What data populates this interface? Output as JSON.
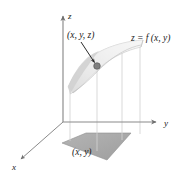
{
  "figure": {
    "background_color": "#ffffff",
    "width": 190,
    "height": 176,
    "axes": {
      "origin": {
        "x": 63,
        "y": 122
      },
      "x_axis": {
        "label": "x",
        "label_x": 14,
        "label_y": 168,
        "direction": "down-left",
        "tip_x": 18,
        "tip_y": 161,
        "color": "#6e6e6e"
      },
      "y_axis": {
        "label": "y",
        "label_x": 166,
        "label_y": 125,
        "direction": "right",
        "tip_x": 158,
        "tip_y": 122,
        "color": "#6e6e6e"
      },
      "z_axis": {
        "label": "z",
        "label_x": 68,
        "label_y": 18,
        "direction": "up",
        "tip_x": 63,
        "tip_y": 14,
        "color": "#6e6e6e"
      }
    },
    "point_label": {
      "text": "(x, y, z)",
      "x": 67,
      "y": 38
    },
    "surface_label": {
      "text": "z = f (x, y)",
      "x": 131,
      "y": 41
    },
    "base_label": {
      "text": "(x, y)",
      "x": 72,
      "y": 154
    },
    "marker_point": {
      "x": 97,
      "y": 66,
      "radius": 3.2,
      "color": "#7d7d7d",
      "edge_color": "#4a4a4a"
    },
    "annotation_arrow": {
      "from_x": 82,
      "from_y": 42,
      "to_x": 95,
      "to_y": 63,
      "color": "#2b2b2b"
    },
    "surface": {
      "fill_light": "#fdfdfd",
      "fill_mid": "#ebebeb",
      "fill_dark": "#c9c9c9",
      "edge_color": "#b5b5b5"
    },
    "base_region": {
      "fill": "#a9a9a9",
      "edge_color": "#8d8d8d",
      "corners": [
        {
          "x": 62,
          "y": 143
        },
        {
          "x": 86,
          "y": 133
        },
        {
          "x": 131,
          "y": 133
        },
        {
          "x": 107,
          "y": 160
        }
      ]
    },
    "droplines": {
      "color": "#cfcfcf",
      "lines": [
        {
          "x1": 70,
          "y1": 86,
          "x2": 70,
          "y2": 140
        },
        {
          "x1": 97,
          "y1": 66,
          "x2": 97,
          "y2": 150
        },
        {
          "x1": 122,
          "y1": 44,
          "x2": 122,
          "y2": 140
        },
        {
          "x1": 140,
          "y1": 46,
          "x2": 140,
          "y2": 133
        }
      ]
    }
  }
}
